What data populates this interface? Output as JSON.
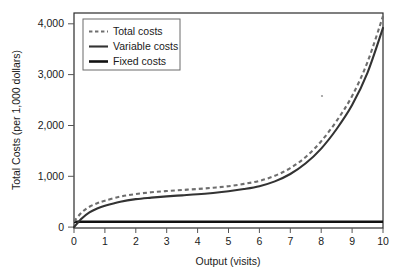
{
  "chart_data": {
    "type": "line",
    "title": "",
    "xlabel": "Output (visits)",
    "ylabel": "Total Costs (per 1,000 dollars)",
    "xlim": [
      0,
      10
    ],
    "ylim": [
      0,
      4300
    ],
    "xticks": [
      "0",
      "1",
      "2",
      "3",
      "4",
      "5",
      "6",
      "7",
      "8",
      "9",
      "10"
    ],
    "yticks": [
      "0",
      "1,000",
      "2,000",
      "3,000",
      "4,000"
    ],
    "ytick_values": [
      0,
      1000,
      2000,
      3000,
      4000
    ],
    "grid": false,
    "legend_position": "top-left",
    "x": [
      0,
      0.25,
      0.5,
      0.75,
      1,
      1.5,
      2,
      2.5,
      3,
      3.5,
      4,
      4.5,
      5,
      5.5,
      6,
      6.5,
      7,
      7.5,
      8,
      8.5,
      9,
      9.5,
      10
    ],
    "series": [
      {
        "name": "Total costs",
        "style": "dashed",
        "color": "#6e6e6e",
        "values": [
          110,
          290,
          400,
          470,
          520,
          600,
          650,
          685,
          710,
          730,
          750,
          775,
          805,
          850,
          910,
          1010,
          1160,
          1380,
          1690,
          2090,
          2580,
          3250,
          4150
        ]
      },
      {
        "name": "Variable costs",
        "style": "solid",
        "color": "#333333",
        "values": [
          0,
          170,
          290,
          365,
          420,
          500,
          550,
          580,
          605,
          625,
          645,
          672,
          705,
          748,
          805,
          900,
          1045,
          1255,
          1545,
          1930,
          2400,
          3040,
          3920
        ]
      },
      {
        "name": "Fixed costs",
        "style": "solid-thick",
        "color": "#111111",
        "values": [
          105,
          105,
          105,
          105,
          105,
          105,
          105,
          105,
          105,
          105,
          105,
          105,
          105,
          105,
          105,
          105,
          105,
          105,
          105,
          105,
          105,
          105,
          105
        ]
      }
    ]
  },
  "legend": {
    "items": [
      {
        "label": "Total costs",
        "swatch": "dashed-line-swatch"
      },
      {
        "label": "Variable costs",
        "swatch": "solid-line-swatch"
      },
      {
        "label": "Fixed costs",
        "swatch": "solid-thick-line-swatch"
      }
    ]
  }
}
